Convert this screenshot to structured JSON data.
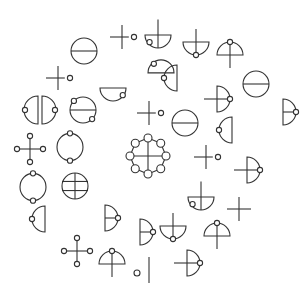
{
  "canvas": {
    "width": 308,
    "height": 301,
    "background": "#ffffff",
    "stroke": "#333333"
  },
  "glyphs": [
    {
      "name": "cross-with-dot-glyph",
      "type": "cross_dot",
      "x": 122,
      "y": 37,
      "s": 12
    },
    {
      "name": "half-circle-cross-glyph",
      "type": "bowl_cross_loop",
      "x": 158,
      "y": 35,
      "s": 13
    },
    {
      "name": "circle-bar-glyph",
      "type": "circle_bar",
      "x": 84,
      "y": 51,
      "s": 13
    },
    {
      "name": "bowl-cross-dot-glyph",
      "type": "bowl_cross_dot",
      "x": 196,
      "y": 42,
      "s": 13
    },
    {
      "name": "dome-cross-dot-glyph",
      "type": "dome_cross_dot",
      "x": 230,
      "y": 55,
      "s": 13
    },
    {
      "name": "dome-loop-glyph",
      "type": "dome_loop",
      "x": 161,
      "y": 69,
      "s": 13
    },
    {
      "name": "cross-with-dot-glyph",
      "type": "cross_dot",
      "x": 58,
      "y": 78,
      "s": 12
    },
    {
      "name": "left-half-dot-glyph",
      "type": "left_half_dot",
      "x": 177,
      "y": 78,
      "s": 13
    },
    {
      "name": "circle-bar-glyph",
      "type": "circle_bar",
      "x": 256,
      "y": 84,
      "s": 13
    },
    {
      "name": "bowl-loop-glyph",
      "type": "bowl_loop",
      "x": 113,
      "y": 88,
      "s": 13
    },
    {
      "name": "right-half-cross-dot-glyph",
      "type": "right_half_cross_dot",
      "x": 217,
      "y": 99,
      "s": 13
    },
    {
      "name": "split-circle-glyph",
      "type": "split_circle",
      "x": 40,
      "y": 110,
      "s": 14
    },
    {
      "name": "circle-bar-dots-glyph",
      "type": "circle_bar_dots",
      "x": 83,
      "y": 110,
      "s": 13
    },
    {
      "name": "cross-with-dot-glyph",
      "type": "cross_dot",
      "x": 149,
      "y": 113,
      "s": 12
    },
    {
      "name": "right-half-bar-dot-glyph",
      "type": "right_half_bar_dot",
      "x": 283,
      "y": 112,
      "s": 13
    },
    {
      "name": "circle-bar-glyph",
      "type": "circle_bar",
      "x": 185,
      "y": 123,
      "s": 13
    },
    {
      "name": "left-half-dot-glyph",
      "type": "left_half_dot",
      "x": 232,
      "y": 130,
      "s": 13
    },
    {
      "name": "plus-dots-glyph",
      "type": "plus_dots",
      "x": 30,
      "y": 149,
      "s": 13
    },
    {
      "name": "ring-two-dots-glyph",
      "type": "ring_two_dots",
      "x": 70,
      "y": 147,
      "s": 13
    },
    {
      "name": "center-wheel-glyph",
      "type": "wheel",
      "x": 148,
      "y": 156,
      "s": 18
    },
    {
      "name": "cross-with-dot-glyph",
      "type": "cross_dot",
      "x": 206,
      "y": 157,
      "s": 12
    },
    {
      "name": "right-half-cross-dot-glyph",
      "type": "right_half_cross_dot",
      "x": 247,
      "y": 170,
      "s": 13
    },
    {
      "name": "ring-two-dots-glyph",
      "type": "ring_two_dots",
      "x": 33,
      "y": 187,
      "s": 13
    },
    {
      "name": "circle-grid-glyph",
      "type": "circle_grid",
      "x": 75,
      "y": 186,
      "s": 13
    },
    {
      "name": "bowl-cross-loop-glyph",
      "type": "bowl_cross_loop",
      "x": 201,
      "y": 197,
      "s": 13
    },
    {
      "name": "plus-glyph",
      "type": "plus",
      "x": 239,
      "y": 209,
      "s": 12
    },
    {
      "name": "left-half-dot-glyph",
      "type": "left_half_dot",
      "x": 45,
      "y": 219,
      "s": 13
    },
    {
      "name": "right-half-bar-dot-glyph",
      "type": "right_half_bar_dot",
      "x": 105,
      "y": 218,
      "s": 13
    },
    {
      "name": "right-half-bar-dot-glyph",
      "type": "right_half_bar_dot",
      "x": 140,
      "y": 232,
      "s": 13
    },
    {
      "name": "bowl-cross-dot-glyph",
      "type": "bowl_cross_dot",
      "x": 173,
      "y": 226,
      "s": 13
    },
    {
      "name": "dome-cross-dot-glyph",
      "type": "dome_cross_dot",
      "x": 217,
      "y": 236,
      "s": 13
    },
    {
      "name": "plus-dots-glyph",
      "type": "plus_dots",
      "x": 77,
      "y": 251,
      "s": 13
    },
    {
      "name": "dome-cross-dot-glyph",
      "type": "dome_cross_dot",
      "x": 112,
      "y": 264,
      "s": 13
    },
    {
      "name": "small-circle-glyph",
      "type": "small_circle",
      "x": 137,
      "y": 273,
      "s": 3
    },
    {
      "name": "vertical-bar-glyph",
      "type": "vbar",
      "x": 149,
      "y": 270,
      "s": 13
    },
    {
      "name": "right-half-cross-dot-glyph",
      "type": "right_half_cross_dot",
      "x": 187,
      "y": 263,
      "s": 13
    }
  ]
}
